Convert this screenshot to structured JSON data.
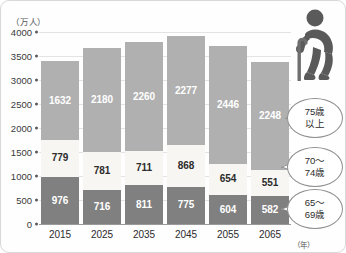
{
  "chart_data": {
    "type": "bar",
    "stacked": true,
    "title": "",
    "xlabel": "（年）",
    "ylabel": "（万人）",
    "categories": [
      "2015",
      "2025",
      "2035",
      "2045",
      "2055",
      "2065"
    ],
    "ylim": [
      0,
      4000
    ],
    "yticks": [
      0,
      500,
      1000,
      1500,
      2000,
      2500,
      3000,
      3500,
      4000
    ],
    "grid": true,
    "legend_position": "right-callouts",
    "series": [
      {
        "name": "65〜\n69歳",
        "key": "age_65_69",
        "color": "#808080",
        "values": [
          976,
          716,
          811,
          775,
          604,
          582
        ]
      },
      {
        "name": "70〜\n74歳",
        "key": "age_70_74",
        "color": "#f7f6f2",
        "values": [
          779,
          781,
          711,
          868,
          654,
          551
        ]
      },
      {
        "name": "75歳\n以上",
        "key": "age_75_plus",
        "color": "#b0b0b0",
        "values": [
          1632,
          2180,
          2260,
          2277,
          2446,
          2248
        ]
      }
    ]
  },
  "axes": {
    "y_unit": "（万人）",
    "x_unit": "（年）",
    "y_ticks": [
      "4000",
      "3500",
      "3000",
      "2500",
      "2000",
      "1500",
      "1000",
      "500",
      "0"
    ],
    "x_ticks": [
      "2015",
      "2025",
      "2035",
      "2045",
      "2055",
      "2065"
    ]
  },
  "callouts": [
    {
      "id": "age-75-plus",
      "line1": "75歳",
      "line2": "以上"
    },
    {
      "id": "age-70-74",
      "line1": "70〜",
      "line2": "74歳"
    },
    {
      "id": "age-65-69",
      "line1": "65〜",
      "line2": "69歳"
    }
  ],
  "values": {
    "y2015": {
      "s75": "1632",
      "s7074": "779",
      "s6569": "976"
    },
    "y2025": {
      "s75": "2180",
      "s7074": "781",
      "s6569": "716"
    },
    "y2035": {
      "s75": "2260",
      "s7074": "711",
      "s6569": "811"
    },
    "y2045": {
      "s75": "2277",
      "s7074": "868",
      "s6569": "775"
    },
    "y2055": {
      "s75": "2446",
      "s7074": "654",
      "s6569": "604"
    },
    "y2065": {
      "s75": "2248",
      "s7074": "551",
      "s6569": "582"
    }
  },
  "icon": {
    "name": "elderly-person-with-cane-icon",
    "color": "#5a5a5a"
  },
  "colors": {
    "age_75_plus": "#b0b0b0",
    "age_70_74": "#f7f6f2",
    "age_65_69": "#808080",
    "gridline": "#e3e3e3",
    "axis": "#9a9a9a"
  }
}
